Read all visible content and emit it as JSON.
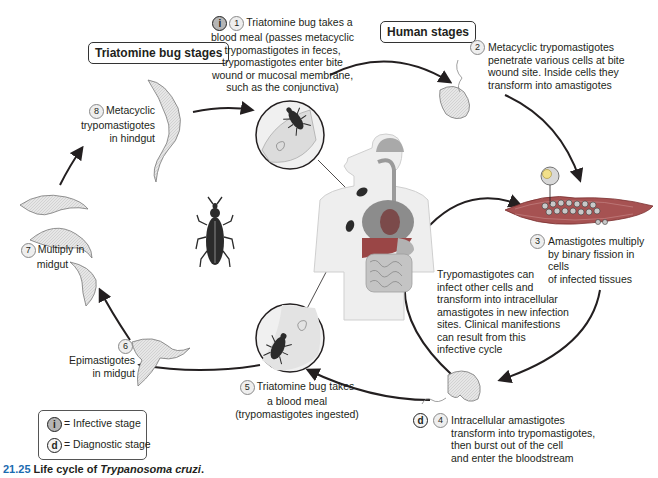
{
  "headers": {
    "triatomine_stages": "Triatomine bug stages",
    "human_stages": "Human stages"
  },
  "steps": [
    {
      "number": "1",
      "badge": "i",
      "text_lines": [
        "Triatomine bug takes a",
        "blood meal (passes metacyclic",
        "trypomastigotes in feces,",
        "trypomastigotes enter bite",
        "wound or mucosal membrane,",
        "such as the conjunctiva)"
      ]
    },
    {
      "number": "2",
      "text_lines": [
        "Metacyclic trypomastigotes",
        "penetrate various cells at bite",
        "wound site. Inside cells they",
        "transform into amastigotes"
      ]
    },
    {
      "number": "3",
      "text_lines": [
        "Amastigotes multiply",
        "by binary fission in cells",
        "of infected tissues"
      ]
    },
    {
      "number": "4",
      "badge": "d",
      "text_lines": [
        "Intracellular amastigotes",
        "transform into trypomastigotes,",
        "then burst out of the cell",
        "and enter the bloodstream"
      ]
    },
    {
      "number": "5",
      "text_lines": [
        "Triatomine bug takes",
        "a blood meal",
        "(trypomastigotes ingested)"
      ]
    },
    {
      "number": "6",
      "text_lines": [
        "Epimastigotes",
        "in midgut"
      ]
    },
    {
      "number": "7",
      "text_lines": [
        "Multiply in",
        "midgut"
      ]
    },
    {
      "number": "8",
      "text_lines": [
        "Metacyclic",
        "trypomastigotes",
        "in hindgut"
      ]
    }
  ],
  "side_note": {
    "text_lines": [
      "Trypomastigotes can",
      "infect other cells and",
      "transform into intracellular",
      "amastigotes in new infection",
      "sites. Clinical manifestions",
      "can result from this",
      "infective cycle"
    ]
  },
  "legend": {
    "infective": {
      "badge": "i",
      "label": "= Infective stage"
    },
    "diagnostic": {
      "badge": "d",
      "label": "= Diagnostic stage"
    }
  },
  "caption": {
    "figure_number": "21.25",
    "prefix": "Life cycle of ",
    "species": "Trypanosoma cruzi",
    "suffix": "."
  },
  "colors": {
    "arrow": "#231f20",
    "parasite_fill": "#d9d9d9",
    "bug": "#2b2b2b",
    "muscle": "#b05a5a",
    "organ_red": "#9a4646",
    "body_outline": "#cfcfcf",
    "caption_accent": "#1a6bb0"
  }
}
